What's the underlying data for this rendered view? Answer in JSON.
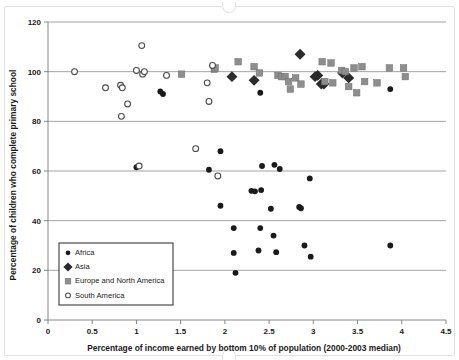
{
  "chart_data": {
    "type": "scatter",
    "title": "",
    "xlabel": "Percentage of income earned by bottom 10% of population (2000-2003 median)",
    "ylabel": "Percentage of children who complete primary school",
    "xlim": [
      0,
      4.5
    ],
    "ylim": [
      0,
      120
    ],
    "xticks": [
      "0",
      "0.5",
      "1",
      "1.5",
      "2",
      "2.5",
      "3",
      "3.5",
      "4",
      "4.5"
    ],
    "xtick_values": [
      0,
      0.5,
      1,
      1.5,
      2,
      2.5,
      3,
      3.5,
      4,
      4.5
    ],
    "yticks": [
      "0",
      "20",
      "40",
      "60",
      "80",
      "100",
      "120"
    ],
    "ytick_values": [
      0,
      20,
      40,
      60,
      80,
      100,
      120
    ],
    "grid": "horizontal",
    "legend_position": "lower-left-inside",
    "series": [
      {
        "name": "Africa",
        "marker": "filled-circle",
        "color": "#1a1a1a",
        "points": [
          [
            1.27,
            92.0
          ],
          [
            1.3,
            91.0
          ],
          [
            2.4,
            91.5
          ],
          [
            3.87,
            93.0
          ],
          [
            1.0,
            61.5
          ],
          [
            1.95,
            68.0
          ],
          [
            1.82,
            60.5
          ],
          [
            2.42,
            62.0
          ],
          [
            2.56,
            62.5
          ],
          [
            2.62,
            60.8
          ],
          [
            2.96,
            57.0
          ],
          [
            2.3,
            52.0
          ],
          [
            2.34,
            51.8
          ],
          [
            2.41,
            52.3
          ],
          [
            1.95,
            46.0
          ],
          [
            2.52,
            44.8
          ],
          [
            2.84,
            45.5
          ],
          [
            2.86,
            45.0
          ],
          [
            2.1,
            37.0
          ],
          [
            2.4,
            37.0
          ],
          [
            2.55,
            34.0
          ],
          [
            2.1,
            27.0
          ],
          [
            2.38,
            28.0
          ],
          [
            2.58,
            27.3
          ],
          [
            2.9,
            30.0
          ],
          [
            2.97,
            25.5
          ],
          [
            3.87,
            30.0
          ],
          [
            2.12,
            19.0
          ]
        ]
      },
      {
        "name": "Asia",
        "marker": "filled-diamond",
        "color": "#2b2b2b",
        "points": [
          [
            2.08,
            98.0
          ],
          [
            2.33,
            96.5
          ],
          [
            2.85,
            107.0
          ],
          [
            3.05,
            98.5
          ],
          [
            3.09,
            95.0
          ],
          [
            3.12,
            95.0
          ],
          [
            3.33,
            99.5
          ],
          [
            3.4,
            97.5
          ],
          [
            3.02,
            98.0
          ]
        ]
      },
      {
        "name": "Europe and North America",
        "marker": "filled-square",
        "color": "#8d8d8d",
        "points": [
          [
            1.51,
            99.0
          ],
          [
            1.88,
            101.0
          ],
          [
            1.89,
            101.5
          ],
          [
            2.15,
            104.0
          ],
          [
            2.33,
            102.0
          ],
          [
            2.39,
            99.5
          ],
          [
            2.6,
            98.5
          ],
          [
            2.64,
            98.0
          ],
          [
            2.68,
            98.0
          ],
          [
            2.72,
            96.0
          ],
          [
            2.74,
            93.0
          ],
          [
            2.8,
            97.5
          ],
          [
            2.86,
            95.0
          ],
          [
            3.1,
            104.0
          ],
          [
            3.13,
            96.0
          ],
          [
            3.2,
            103.5
          ],
          [
            3.22,
            95.5
          ],
          [
            3.32,
            100.5
          ],
          [
            3.36,
            100.0
          ],
          [
            3.4,
            94.0
          ],
          [
            3.46,
            101.5
          ],
          [
            3.49,
            91.5
          ],
          [
            3.55,
            102.0
          ],
          [
            3.58,
            96.0
          ],
          [
            3.72,
            95.5
          ],
          [
            3.86,
            101.5
          ],
          [
            4.02,
            101.5
          ],
          [
            4.04,
            98.0
          ]
        ]
      },
      {
        "name": "South America",
        "marker": "open-circle",
        "color": "#4d4d4d",
        "points": [
          [
            0.3,
            100.0
          ],
          [
            0.65,
            93.5
          ],
          [
            0.82,
            94.5
          ],
          [
            0.84,
            93.5
          ],
          [
            0.83,
            82.0
          ],
          [
            0.9,
            87.0
          ],
          [
            1.0,
            100.5
          ],
          [
            1.06,
            110.5
          ],
          [
            1.07,
            99.0
          ],
          [
            1.09,
            100.0
          ],
          [
            1.34,
            98.5
          ],
          [
            1.8,
            95.5
          ],
          [
            1.86,
            102.5
          ],
          [
            1.82,
            88.0
          ],
          [
            1.67,
            69.0
          ],
          [
            1.03,
            62.0
          ],
          [
            1.92,
            58.0
          ]
        ]
      }
    ]
  },
  "legend": {
    "items": [
      {
        "label": "Africa",
        "marker": "filled-circle"
      },
      {
        "label": "Asia",
        "marker": "filled-diamond"
      },
      {
        "label": "Europe and North America",
        "marker": "filled-square"
      },
      {
        "label": "South America",
        "marker": "open-circle"
      }
    ]
  },
  "colors": {
    "africa": "#1a1a1a",
    "asia": "#2b2b2b",
    "europe_north_america": "#8d8d8d",
    "south_america": "#4d4d4d",
    "gridline": "#8c8c8c",
    "axis": "#7a7a7a",
    "text": "#1a1a1a",
    "background": "#ffffff"
  }
}
